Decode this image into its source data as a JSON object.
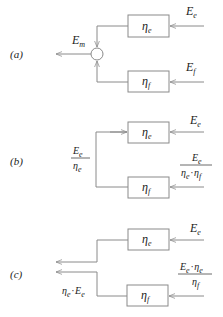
{
  "diagram": {
    "panels": [
      {
        "id": "a",
        "label": "(a)",
        "blocks": [
          {
            "name": "eta_e",
            "symbol": "η",
            "sub": "e"
          },
          {
            "name": "eta_f",
            "symbol": "η",
            "sub": "f"
          }
        ],
        "inputs": [
          {
            "symbol": "E",
            "sub": "e"
          },
          {
            "symbol": "E",
            "sub": "f"
          }
        ],
        "output": {
          "symbol": "E",
          "sub": "m"
        },
        "junction": "summing-node"
      },
      {
        "id": "b",
        "label": "(b)",
        "blocks": [
          {
            "name": "eta_e",
            "symbol": "η",
            "sub": "e"
          },
          {
            "name": "eta_f",
            "symbol": "η",
            "sub": "f"
          }
        ],
        "inputs": [
          {
            "symbol": "E",
            "sub": "e"
          },
          {
            "numerator": "E_e",
            "denominator": "η_e · η_f"
          }
        ],
        "branch_label": {
          "numerator": "E_e",
          "denominator": "η_e"
        }
      },
      {
        "id": "c",
        "label": "(c)",
        "blocks": [
          {
            "name": "eta_e",
            "symbol": "η",
            "sub": "e"
          },
          {
            "name": "eta_f",
            "symbol": "η",
            "sub": "f"
          }
        ],
        "inputs": [
          {
            "symbol": "E",
            "sub": "e"
          },
          {
            "numerator": "E_e · η_e",
            "denominator": "η_f"
          }
        ],
        "output_label": "η_e · E_e"
      }
    ],
    "text": {
      "a_label": "(a)",
      "b_label": "(b)",
      "c_label": "(c)",
      "eta": "η",
      "E": "E",
      "sub_e": "e",
      "sub_f": "f",
      "sub_m": "m",
      "dot": "·"
    },
    "colors": {
      "line": "#8a8a8a",
      "text": "#222222",
      "background": "#ffffff"
    }
  }
}
